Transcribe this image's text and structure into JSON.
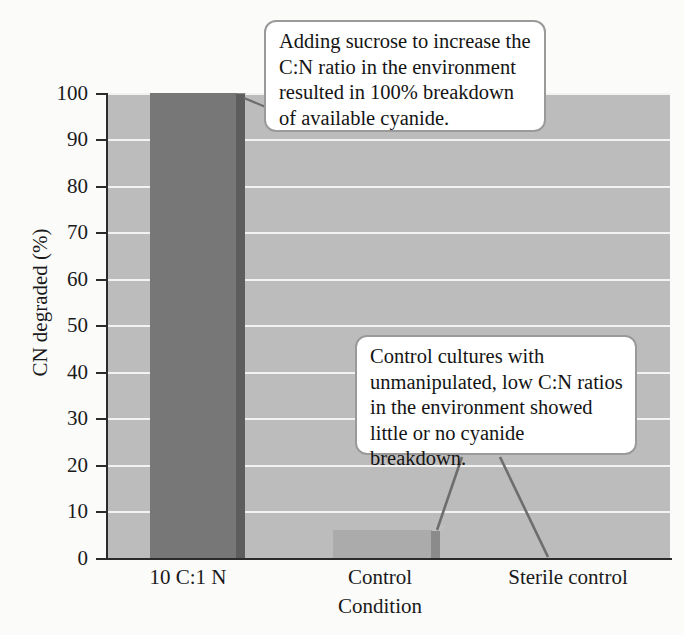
{
  "chart_data": {
    "type": "bar",
    "title": "",
    "xlabel": "Condition",
    "ylabel": "CN degraded (%)",
    "categories": [
      "10 C:1 N",
      "Control",
      "Sterile control"
    ],
    "values": [
      100,
      6,
      0
    ],
    "ylim": [
      0,
      100
    ],
    "yticks": [
      0,
      10,
      20,
      30,
      40,
      50,
      60,
      70,
      80,
      90,
      100
    ],
    "ytick_labels": [
      "0",
      "10",
      "20",
      "30",
      "40",
      "50",
      "60",
      "70",
      "80",
      "90",
      "100"
    ],
    "grid": "horizontal white gridlines on gray plot background",
    "legend": "none",
    "bar_colors": [
      "#777777",
      "#ababab",
      "#ababab"
    ],
    "plot_background": "#bcbcbc",
    "gridline_color": "#f2f2f2",
    "annotations": [
      {
        "id": "sucrose-note",
        "text": "Adding sucrose to increase the C:N ratio in the environment resulted in 100% breakdown of available cyanide.",
        "lines": [
          "Adding sucrose to increase the",
          "C:N ratio in the environment",
          "resulted in 100% breakdown",
          "of available cyanide."
        ],
        "points_to": [
          "10 C:1 N"
        ]
      },
      {
        "id": "control-note",
        "text": "Control cultures with unmanipulated, low C:N ratios in the environment showed little or no cyanide breakdown.",
        "lines": [
          "Control cultures with",
          "unmanipulated, low C:N ratios",
          "in the environment showed",
          "little or no cyanide breakdown."
        ],
        "points_to": [
          "Control",
          "Sterile control"
        ]
      }
    ]
  },
  "axes": {
    "y_title": "CN degraded (%)",
    "x_title": "Condition",
    "y_ticks": [
      "100",
      "90",
      "80",
      "70",
      "60",
      "50",
      "40",
      "30",
      "20",
      "10",
      "0"
    ],
    "x_ticks": [
      "10 C:1 N",
      "Control",
      "Sterile control"
    ]
  },
  "callouts": {
    "sucrose": {
      "line1": "Adding sucrose to increase the",
      "line2": "C:N ratio in the environment",
      "line3": "resulted in 100% breakdown",
      "line4": "of available cyanide."
    },
    "control": {
      "line1": "Control cultures with",
      "line2": "unmanipulated, low C:N ratios",
      "line3": "in the environment showed",
      "line4": "little or no cyanide breakdown."
    }
  },
  "colors": {
    "plot_background": "#bcbcbc",
    "gridline": "#f2f2f2",
    "bar_primary": "#777777",
    "bar_secondary": "#ababab",
    "axis": "#2b2b2b",
    "callout_border": "#9a9a9a",
    "callout_fill": "#ffffff",
    "leader_line": "#6d6d6d",
    "text": "#141414"
  }
}
